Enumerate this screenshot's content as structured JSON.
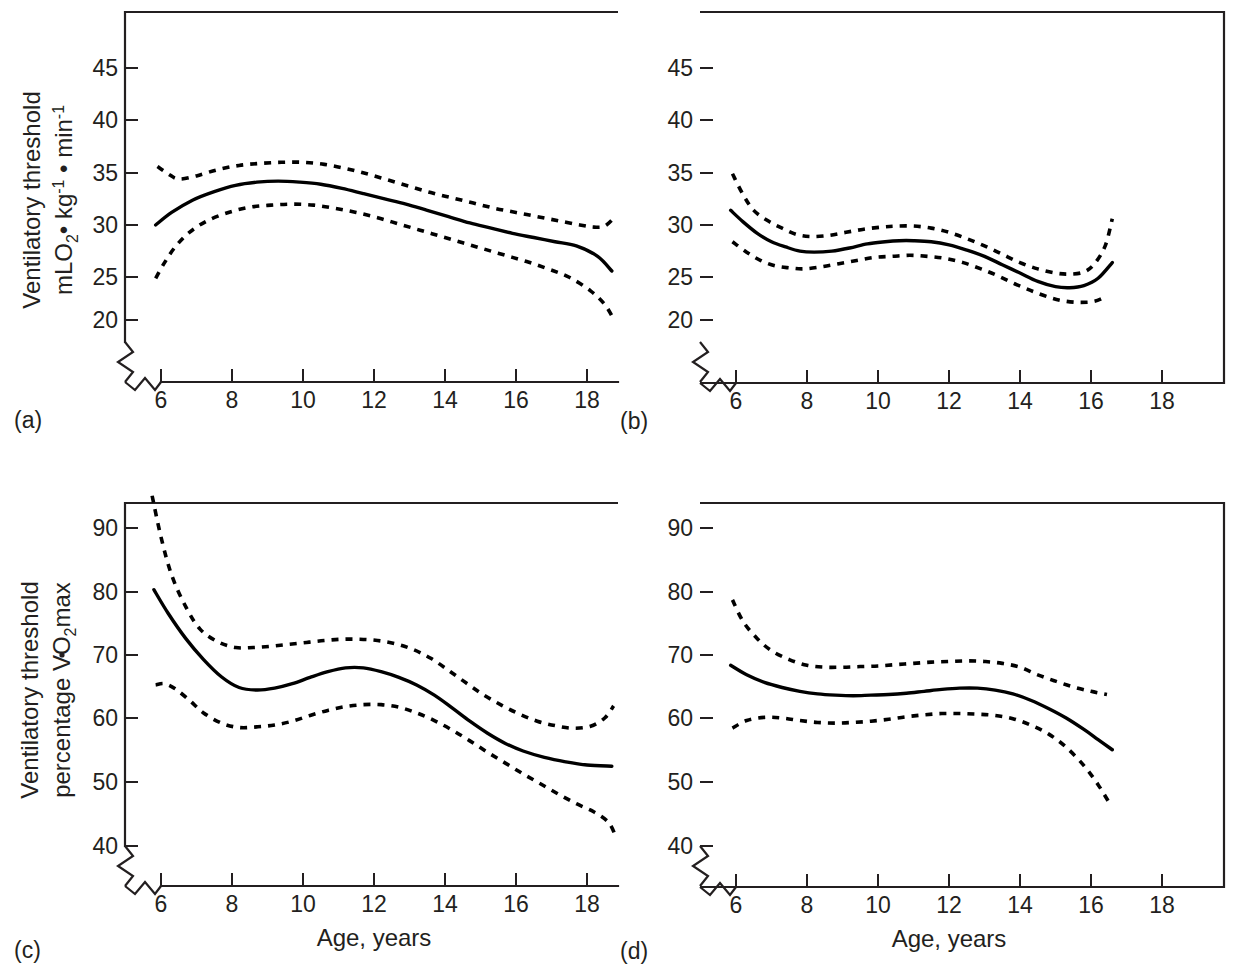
{
  "figure": {
    "panel_count": 4,
    "xlabel": "Age, years",
    "ylabel_absolute_line1": "Ventilatory threshold",
    "ylabel_absolute_line2_prefix": "mLO",
    "ylabel_absolute_line2_sub1": "2",
    "ylabel_absolute_line2_mid": "• kg",
    "ylabel_absolute_line2_sup1": "-1",
    "ylabel_absolute_line2_mid2": " • min",
    "ylabel_absolute_line2_sup2": "-1",
    "ylabel_percent_line1": "Ventilatory threshold",
    "ylabel_percent_line2_prefix": "percentage VO",
    "ylabel_percent_line2_sub": "2",
    "ylabel_percent_line2_suffix": "max",
    "line_colors": {
      "mean": "#000000",
      "confidence": "#000000",
      "axis": "#231f20"
    },
    "xticks": [
      "6",
      "8",
      "10",
      "12",
      "14",
      "16",
      "18"
    ],
    "yticks_absolute": [
      "45",
      "40",
      "35",
      "30",
      "25",
      "20"
    ],
    "yticks_percent": [
      "90",
      "80",
      "70",
      "60",
      "50",
      "40"
    ]
  },
  "chart_data": [
    {
      "id": "a",
      "type": "line",
      "panel_label": "(a)",
      "title": "",
      "xlabel": "Age, years",
      "ylabel": "Ventilatory threshold mLO2 • kg-1 • min-1",
      "xlim": [
        5.3,
        19.6
      ],
      "ylim": [
        17.5,
        48.5
      ],
      "xticks": [
        6,
        8,
        10,
        12,
        14,
        16,
        18
      ],
      "yticks": [
        20,
        25,
        30,
        35,
        40,
        45
      ],
      "axis_break": true,
      "grid": false,
      "legend": "none",
      "series": [
        {
          "name": "mean",
          "style": "solid",
          "x": [
            5.85,
            6.3,
            6.9,
            7.5,
            8.1,
            8.7,
            9.3,
            9.9,
            10.5,
            11.1,
            11.7,
            12.3,
            12.9,
            13.5,
            14.1,
            14.7,
            15.3,
            15.9,
            16.5,
            17.1,
            17.7,
            18.3,
            18.7
          ],
          "y": [
            30.0,
            31.2,
            32.4,
            33.2,
            33.8,
            34.1,
            34.2,
            34.1,
            33.9,
            33.5,
            33.0,
            32.5,
            32.0,
            31.4,
            30.8,
            30.2,
            29.7,
            29.2,
            28.8,
            28.4,
            28.0,
            27.0,
            25.6
          ]
        },
        {
          "name": "upper_confidence",
          "style": "dashed",
          "x": [
            5.9,
            6.2,
            6.5,
            7.0,
            7.6,
            8.2,
            8.8,
            9.4,
            10.0,
            10.6,
            11.2,
            11.8,
            12.4,
            13.0,
            13.6,
            14.2,
            14.8,
            15.4,
            16.0,
            16.6,
            17.2,
            17.8,
            18.2,
            18.5,
            18.8
          ],
          "y": [
            35.6,
            34.9,
            34.4,
            34.7,
            35.3,
            35.7,
            35.9,
            36.0,
            36.0,
            35.8,
            35.4,
            34.9,
            34.3,
            33.7,
            33.1,
            32.6,
            32.1,
            31.6,
            31.2,
            30.8,
            30.4,
            30.0,
            29.8,
            29.9,
            30.8
          ]
        },
        {
          "name": "lower_confidence",
          "style": "dashed",
          "x": [
            5.85,
            6.1,
            6.4,
            6.8,
            7.3,
            7.9,
            8.5,
            9.1,
            9.7,
            10.3,
            10.9,
            11.5,
            12.1,
            12.7,
            13.3,
            13.9,
            14.5,
            15.1,
            15.7,
            16.3,
            16.9,
            17.5,
            18.1,
            18.5,
            18.75
          ],
          "y": [
            24.9,
            26.4,
            27.9,
            29.3,
            30.4,
            31.2,
            31.7,
            31.9,
            32.0,
            31.9,
            31.6,
            31.2,
            30.7,
            30.1,
            29.5,
            28.9,
            28.3,
            27.7,
            27.1,
            26.5,
            25.8,
            25.0,
            23.7,
            22.4,
            21.0
          ]
        }
      ]
    },
    {
      "id": "b",
      "type": "line",
      "panel_label": "(b)",
      "title": "",
      "xlabel": "Age, years",
      "ylabel": "Ventilatory threshold mLO2 • kg-1 • min-1",
      "xlim": [
        5.3,
        19.6
      ],
      "ylim": [
        17.5,
        48.5
      ],
      "xticks": [
        6,
        8,
        10,
        12,
        14,
        16,
        18
      ],
      "yticks": [
        20,
        25,
        30,
        35,
        40,
        45
      ],
      "axis_break": true,
      "grid": false,
      "legend": "none",
      "series": [
        {
          "name": "mean",
          "style": "solid",
          "x": [
            5.85,
            6.2,
            6.6,
            7.0,
            7.4,
            7.8,
            8.2,
            8.7,
            9.2,
            9.7,
            10.2,
            10.6,
            11.0,
            11.5,
            12.0,
            12.5,
            13.0,
            13.5,
            14.0,
            14.5,
            15.0,
            15.4,
            15.8,
            16.2,
            16.6
          ],
          "y": [
            31.4,
            30.3,
            29.2,
            28.4,
            27.9,
            27.5,
            27.4,
            27.5,
            27.8,
            28.2,
            28.4,
            28.5,
            28.5,
            28.4,
            28.1,
            27.6,
            27.0,
            26.2,
            25.4,
            24.6,
            24.1,
            24.0,
            24.2,
            24.9,
            26.4
          ]
        },
        {
          "name": "upper_confidence",
          "style": "dashed",
          "x": [
            5.9,
            6.2,
            6.5,
            6.9,
            7.3,
            7.7,
            8.1,
            8.6,
            9.1,
            9.6,
            10.1,
            10.5,
            11.0,
            11.5,
            12.0,
            12.5,
            13.0,
            13.5,
            14.0,
            14.5,
            15.0,
            15.4,
            15.8,
            16.1,
            16.4,
            16.6
          ],
          "y": [
            34.9,
            32.9,
            31.4,
            30.4,
            29.7,
            29.1,
            28.9,
            29.0,
            29.3,
            29.6,
            29.8,
            29.9,
            29.9,
            29.7,
            29.3,
            28.7,
            28.0,
            27.2,
            26.4,
            25.8,
            25.4,
            25.3,
            25.5,
            26.3,
            28.0,
            30.6
          ]
        },
        {
          "name": "lower_confidence",
          "style": "dashed",
          "x": [
            5.9,
            6.3,
            6.7,
            7.1,
            7.5,
            7.9,
            8.4,
            8.9,
            9.4,
            9.9,
            10.4,
            10.9,
            11.4,
            11.9,
            12.4,
            12.9,
            13.4,
            13.9,
            14.4,
            14.9,
            15.3,
            15.7,
            16.1,
            16.45
          ],
          "y": [
            28.4,
            27.4,
            26.6,
            26.1,
            25.9,
            25.8,
            26.0,
            26.3,
            26.6,
            26.9,
            27.0,
            27.1,
            27.0,
            26.8,
            26.4,
            25.8,
            25.1,
            24.3,
            23.6,
            23.0,
            22.7,
            22.6,
            22.7,
            23.2
          ]
        }
      ]
    },
    {
      "id": "c",
      "type": "line",
      "panel_label": "(c)",
      "title": "",
      "xlabel": "Age, years",
      "ylabel": "Ventilatory threshold percentage VO2max",
      "xlim": [
        5.3,
        19.6
      ],
      "ylim": [
        36.5,
        95.0
      ],
      "xticks": [
        6,
        8,
        10,
        12,
        14,
        16,
        18
      ],
      "yticks": [
        40,
        50,
        60,
        70,
        80,
        90
      ],
      "axis_break": true,
      "grid": false,
      "legend": "none",
      "series": [
        {
          "name": "mean",
          "style": "solid",
          "x": [
            5.8,
            6.2,
            6.7,
            7.2,
            7.7,
            8.2,
            8.7,
            9.2,
            9.7,
            10.2,
            10.7,
            11.2,
            11.7,
            12.2,
            12.7,
            13.2,
            13.7,
            14.2,
            14.7,
            15.2,
            15.7,
            16.2,
            16.8,
            17.4,
            18.0,
            18.7
          ],
          "y": [
            80.2,
            76.5,
            72.5,
            69.2,
            66.5,
            64.8,
            64.4,
            64.7,
            65.4,
            66.4,
            67.3,
            67.9,
            67.9,
            67.3,
            66.4,
            65.2,
            63.6,
            61.6,
            59.5,
            57.6,
            56.0,
            54.8,
            53.8,
            53.1,
            52.6,
            52.4
          ]
        },
        {
          "name": "upper_confidence",
          "style": "dashed",
          "x": [
            5.75,
            6.0,
            6.3,
            6.7,
            7.1,
            7.6,
            8.1,
            8.6,
            9.1,
            9.6,
            10.1,
            10.6,
            11.1,
            11.6,
            12.1,
            12.6,
            13.1,
            13.6,
            14.1,
            14.6,
            15.1,
            15.6,
            16.1,
            16.6,
            17.1,
            17.6,
            18.1,
            18.5,
            18.75
          ],
          "y": [
            95.0,
            88.5,
            82.5,
            77.5,
            74.0,
            72.0,
            71.1,
            71.1,
            71.3,
            71.6,
            71.9,
            72.2,
            72.4,
            72.4,
            72.2,
            71.7,
            70.8,
            69.4,
            67.5,
            65.5,
            63.6,
            62.0,
            60.6,
            59.5,
            58.8,
            58.4,
            58.7,
            60.0,
            61.9
          ]
        },
        {
          "name": "lower_confidence",
          "style": "dashed",
          "x": [
            5.85,
            6.1,
            6.4,
            6.8,
            7.2,
            7.7,
            8.2,
            8.7,
            9.2,
            9.7,
            10.2,
            10.7,
            11.2,
            11.7,
            12.2,
            12.7,
            13.2,
            13.7,
            14.2,
            14.7,
            15.2,
            15.7,
            16.2,
            16.7,
            17.2,
            17.7,
            18.2,
            18.6,
            18.8
          ],
          "y": [
            65.2,
            65.4,
            64.6,
            62.8,
            60.8,
            59.2,
            58.5,
            58.6,
            58.9,
            59.5,
            60.4,
            61.2,
            61.8,
            62.1,
            62.1,
            61.7,
            60.8,
            59.6,
            58.1,
            56.4,
            54.6,
            52.9,
            51.2,
            49.6,
            48.0,
            46.5,
            45.2,
            43.6,
            41.5
          ]
        }
      ]
    },
    {
      "id": "d",
      "type": "line",
      "panel_label": "(d)",
      "title": "",
      "xlabel": "Age, years",
      "ylabel": "Ventilatory threshold percentage VO2max",
      "xlim": [
        5.3,
        19.6
      ],
      "ylim": [
        36.5,
        95.0
      ],
      "xticks": [
        6,
        8,
        10,
        12,
        14,
        16,
        18
      ],
      "yticks": [
        40,
        50,
        60,
        70,
        80,
        90
      ],
      "axis_break": true,
      "grid": false,
      "legend": "none",
      "series": [
        {
          "name": "mean",
          "style": "solid",
          "x": [
            5.85,
            6.3,
            6.8,
            7.3,
            7.8,
            8.3,
            8.8,
            9.3,
            9.8,
            10.3,
            10.8,
            11.3,
            11.8,
            12.3,
            12.8,
            13.3,
            13.8,
            14.3,
            14.8,
            15.3,
            15.8,
            16.2,
            16.6
          ],
          "y": [
            68.3,
            66.8,
            65.6,
            64.8,
            64.2,
            63.8,
            63.6,
            63.5,
            63.6,
            63.7,
            63.9,
            64.2,
            64.5,
            64.7,
            64.7,
            64.4,
            63.8,
            62.8,
            61.5,
            60.0,
            58.2,
            56.6,
            55.0
          ]
        },
        {
          "name": "upper_confidence",
          "style": "dashed",
          "x": [
            5.9,
            6.2,
            6.6,
            7.0,
            7.5,
            8.0,
            8.5,
            9.0,
            9.5,
            10.0,
            10.5,
            11.0,
            11.5,
            12.0,
            12.5,
            13.0,
            13.5,
            14.0,
            14.5,
            15.0,
            15.5,
            16.0,
            16.45
          ],
          "y": [
            78.6,
            75.2,
            72.5,
            70.6,
            69.2,
            68.3,
            68.0,
            68.0,
            68.1,
            68.2,
            68.4,
            68.6,
            68.8,
            68.9,
            69.0,
            68.9,
            68.6,
            68.0,
            66.8,
            65.8,
            64.9,
            64.2,
            63.7
          ]
        },
        {
          "name": "lower_confidence",
          "style": "dashed",
          "x": [
            5.9,
            6.3,
            6.8,
            7.3,
            7.8,
            8.3,
            8.8,
            9.3,
            9.8,
            10.3,
            10.8,
            11.3,
            11.8,
            12.3,
            12.8,
            13.3,
            13.8,
            14.3,
            14.8,
            15.3,
            15.8,
            16.2,
            16.55
          ],
          "y": [
            58.4,
            59.6,
            60.1,
            60.0,
            59.6,
            59.3,
            59.2,
            59.3,
            59.5,
            59.8,
            60.2,
            60.5,
            60.7,
            60.7,
            60.6,
            60.4,
            59.9,
            58.9,
            57.5,
            55.4,
            52.5,
            49.5,
            46.3
          ]
        }
      ]
    }
  ]
}
